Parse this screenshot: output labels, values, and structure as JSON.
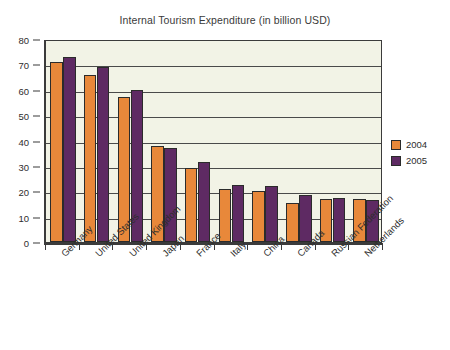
{
  "chart_data": {
    "type": "bar",
    "title": "Internal Tourism Expenditure (in billion USD)",
    "xlabel": "",
    "ylabel": "",
    "ylim": [
      0,
      80
    ],
    "ytick_step": 10,
    "yticks": [
      "0",
      "10",
      "20",
      "30",
      "40",
      "50",
      "60",
      "70",
      "80"
    ],
    "grid": true,
    "legend_position": "right",
    "categories": [
      "Germany",
      "United States",
      "United Kingdom",
      "Japan",
      "France",
      "Italy",
      "China",
      "Canada",
      "Russian Federation",
      "Netherlands"
    ],
    "series": [
      {
        "name": "2004",
        "color": "#e8883a",
        "values": [
          71,
          66,
          57,
          38,
          29,
          21,
          20,
          15.5,
          17,
          17
        ]
      },
      {
        "name": "2005",
        "color": "#5e2a63",
        "values": [
          73,
          69,
          60,
          37,
          31.5,
          22.5,
          22,
          18.5,
          17.5,
          16.5
        ]
      }
    ]
  },
  "legend": {
    "items": [
      {
        "label": "2004",
        "color": "#e8883a"
      },
      {
        "label": "2005",
        "color": "#5e2a63"
      }
    ]
  },
  "colors": {
    "plot_background": "#f2f3e6",
    "page_background": "#ffffff",
    "axis": "#3b3b3b",
    "gridline": "#4a4a4a",
    "text": "#2d2d2d",
    "series_2004": "#e8883a",
    "series_2005": "#5e2a63"
  }
}
